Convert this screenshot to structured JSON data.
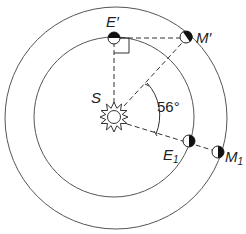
{
  "diagram": {
    "labels": {
      "sun": "S",
      "earth_prime": "E′",
      "mars_prime": "M′",
      "earth_1": "E",
      "earth_1_sub": "1",
      "mars_1": "M",
      "mars_1_sub": "1",
      "angle": "56°"
    },
    "colors": {
      "stroke": "#333333",
      "orbit": "#555555",
      "planet_dark": "#111111",
      "background": "#ffffff"
    }
  }
}
